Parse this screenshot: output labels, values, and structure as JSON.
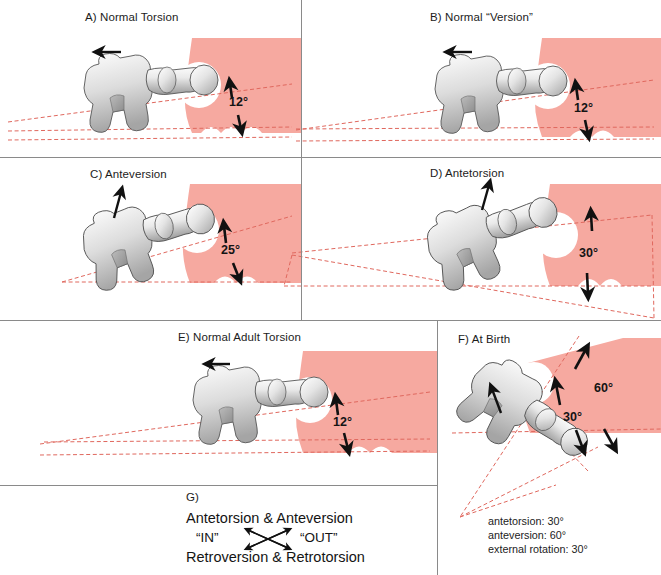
{
  "figure": {
    "background_color": "#ffffff",
    "bone_fill": "#d8d8d8",
    "pelvis_fill": "#f6a9a0",
    "axis_line_color": "#e06a60",
    "divider_color": "#8a8a8a",
    "arrow_color": "#111111"
  },
  "panels": [
    {
      "id": "A",
      "title": "A) Normal Torsion",
      "angle_label": "12",
      "angle_unit": "°",
      "angle_text": "12°"
    },
    {
      "id": "B",
      "title": "B) Normal “Version”",
      "angle_label": "12",
      "angle_unit": "°",
      "angle_text": "12°"
    },
    {
      "id": "C",
      "title": "C) Anteversion",
      "angle_label": "25",
      "angle_unit": "°",
      "angle_text": "25°"
    },
    {
      "id": "D",
      "title": "D) Antetorsion",
      "angle_label": "30",
      "angle_unit": "°",
      "angle_text": "30°"
    },
    {
      "id": "E",
      "title": "E) Normal Adult Torsion",
      "angle_label": "12",
      "angle_unit": "°",
      "angle_text": "12°"
    },
    {
      "id": "F",
      "title": "F) At Birth",
      "angle_inner": "30°",
      "angle_outer": "60°",
      "notes": [
        "antetorsion: 30°",
        "anteversion: 60°",
        "external rotation: 30°"
      ]
    },
    {
      "id": "G",
      "title": "G)",
      "line_top": "Antetorsion  &  Anteversion",
      "line_mid_left": "“IN”",
      "line_mid_right": "“OUT”",
      "line_bottom": "Retroversion  &  Retrotorsion"
    }
  ]
}
